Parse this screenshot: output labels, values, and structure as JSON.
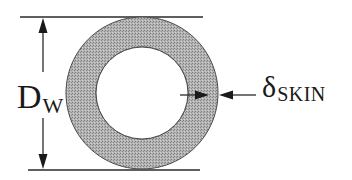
{
  "diagram": {
    "outer_diameter_label": {
      "symbol": "D",
      "subscript": "W"
    },
    "skin_depth_label": {
      "symbol": "δ",
      "subscript": "SKIN"
    },
    "colors": {
      "annulus_fill": "#a9a9a9",
      "annulus_stroke": "#4a4a4a",
      "line": "#2a2a2a",
      "background": "#ffffff",
      "core_fill": "#ffffff"
    },
    "geometry": {
      "center_x": 142,
      "center_y": 93,
      "outer_radius": 76,
      "inner_radius": 46,
      "top_line_y": 17,
      "bottom_line_y": 170,
      "dimension_arrow_x": 43
    }
  }
}
